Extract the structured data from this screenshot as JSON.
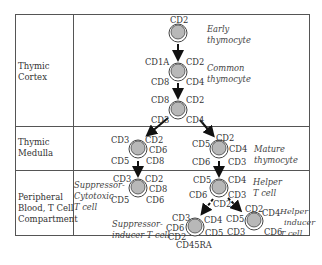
{
  "rows": [
    {
      "label_line1": "Thymic",
      "label_line2": "Cortex"
    },
    {
      "label_line1": "Thymic",
      "label_line2": "Medulla"
    },
    {
      "label_line1": "Peripheral",
      "label_line2": "Blood, T Cell",
      "label_line3": "Compartment"
    }
  ],
  "cells": {
    "early": {
      "markers": [
        "CD2"
      ],
      "desc_line1": "Early",
      "desc_line2": "thymocyte"
    },
    "common": {
      "markers": [
        "CD1A",
        "CD2",
        "CD8",
        "CD4"
      ],
      "desc_line1": "Common",
      "desc_line2": "thymocyte"
    },
    "cortex3": {
      "markers": [
        "CD8",
        "CD2",
        "CD3",
        "CD4"
      ]
    },
    "medulla_left": {
      "markers": [
        "CD3",
        "CD2",
        "CD6",
        "CD5",
        "CD8"
      ]
    },
    "mature": {
      "markers": [
        "CD5",
        "CD2",
        "CD4",
        "CD6",
        "CD3"
      ],
      "desc_line1": "Mature",
      "desc_line2": "thymocyte"
    },
    "supp_cyto": {
      "markers": [
        "CD3",
        "CD2",
        "CD8",
        "CD5",
        "CD6"
      ],
      "desc_line1": "Suppressor-",
      "desc_line2": "Cytotoxic",
      "desc_line3": "T cell"
    },
    "helper": {
      "markers": [
        "CD5",
        "CD4",
        "CD6",
        "CD3",
        "CD2"
      ],
      "desc_line1": "Helper",
      "desc_line2": "T cell"
    },
    "supp_inducer": {
      "markers": [
        "CD3",
        "CD4",
        "CD6",
        "CD5",
        "CD2",
        "CD45RA"
      ],
      "desc_line1": "Suppressor-",
      "desc_line2": "inducer T cell"
    },
    "helper_inducer": {
      "markers": [
        "CD5",
        "CD2",
        "CD4",
        "CD3",
        "CD6"
      ],
      "desc_line1": "Helper",
      "desc_line2": "inducer",
      "desc_line3": "T cell"
    }
  },
  "colors": {
    "cell_fill": "#b8b8b8",
    "line": "#555555",
    "arrow": "#111111"
  }
}
